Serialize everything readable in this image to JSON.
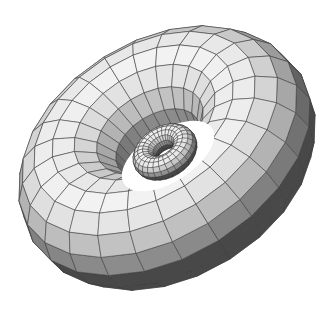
{
  "figure": {
    "background": "#ffffff",
    "edge_color": "#3a3a3a",
    "shade_range": [
      "#4a4a4a",
      "#f2f2f2"
    ]
  },
  "tori": [
    {
      "name": "large-torus",
      "center": [
        167,
        158
      ],
      "major_radius": 100,
      "minor_radius": 58,
      "segments_u": 24,
      "segments_v": 16,
      "tilt_x_deg": 52,
      "rot_z_deg": -32,
      "scale": 1.0
    },
    {
      "name": "small-torus",
      "center": [
        165,
        152
      ],
      "major_radius": 22,
      "minor_radius": 12,
      "segments_u": 28,
      "segments_v": 14,
      "tilt_x_deg": 52,
      "rot_z_deg": -32,
      "scale": 1.0
    }
  ],
  "hole": {
    "center": [
      168,
      156
    ],
    "rx": 52,
    "ry": 26,
    "rotate_deg": -32,
    "fill": "#ffffff"
  }
}
